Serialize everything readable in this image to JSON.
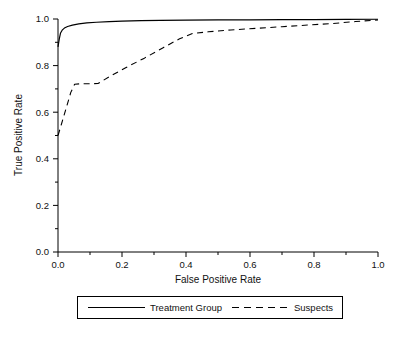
{
  "chart_data": {
    "type": "line",
    "title": "",
    "xlabel": "False Positive Rate",
    "ylabel": "True Positive Rate",
    "xlim": [
      0.0,
      1.0
    ],
    "ylim": [
      0.0,
      1.0
    ],
    "grid": false,
    "legend_position": "bottom",
    "x_ticks": [
      0.0,
      0.2,
      0.4,
      0.6,
      0.8,
      1.0
    ],
    "x_ticklabels": [
      "0.0",
      "0.2",
      "0.4",
      "0.6",
      "0.8",
      "1.0"
    ],
    "y_ticks": [
      0.0,
      0.2,
      0.4,
      0.6,
      0.8,
      1.0
    ],
    "y_ticklabels": [
      "0.0",
      "0.2",
      "0.4",
      "0.6",
      "0.8",
      "1.0"
    ],
    "minor_tick_step": 0.1,
    "series": [
      {
        "name": "Treatment Group",
        "style": "solid",
        "color": "#000000",
        "points": [
          [
            0.0,
            0.88
          ],
          [
            0.004,
            0.915
          ],
          [
            0.008,
            0.94
          ],
          [
            0.013,
            0.952
          ],
          [
            0.02,
            0.961
          ],
          [
            0.03,
            0.968
          ],
          [
            0.045,
            0.974
          ],
          [
            0.065,
            0.979
          ],
          [
            0.09,
            0.983
          ],
          [
            0.12,
            0.986
          ],
          [
            0.16,
            0.989
          ],
          [
            0.2,
            0.991
          ],
          [
            0.26,
            0.993
          ],
          [
            0.32,
            0.994
          ],
          [
            0.4,
            0.995
          ],
          [
            0.5,
            0.996
          ],
          [
            0.6,
            0.996
          ],
          [
            0.7,
            0.997
          ],
          [
            0.8,
            0.997
          ],
          [
            0.9,
            0.998
          ],
          [
            1.0,
            0.999
          ]
        ]
      },
      {
        "name": "Suspects",
        "style": "dashed",
        "color": "#000000",
        "points": [
          [
            0.0,
            0.5
          ],
          [
            0.01,
            0.545
          ],
          [
            0.025,
            0.615
          ],
          [
            0.04,
            0.685
          ],
          [
            0.052,
            0.72
          ],
          [
            0.07,
            0.722
          ],
          [
            0.095,
            0.722
          ],
          [
            0.125,
            0.723
          ],
          [
            0.16,
            0.752
          ],
          [
            0.21,
            0.79
          ],
          [
            0.27,
            0.832
          ],
          [
            0.33,
            0.878
          ],
          [
            0.38,
            0.915
          ],
          [
            0.42,
            0.938
          ],
          [
            0.47,
            0.945
          ],
          [
            0.54,
            0.953
          ],
          [
            0.62,
            0.96
          ],
          [
            0.7,
            0.967
          ],
          [
            0.78,
            0.974
          ],
          [
            0.86,
            0.981
          ],
          [
            0.93,
            0.989
          ],
          [
            1.0,
            0.996
          ]
        ]
      }
    ]
  },
  "legend": {
    "entries": [
      {
        "label": "Treatment Group",
        "style": "solid"
      },
      {
        "label": "Suspects",
        "style": "dashed"
      }
    ]
  }
}
